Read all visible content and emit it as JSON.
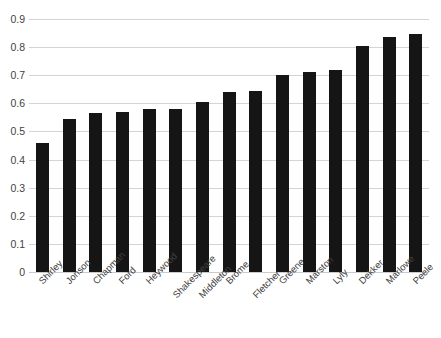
{
  "chart_data": {
    "type": "bar",
    "title": "",
    "subtitle": "",
    "xlabel": "",
    "ylabel": "",
    "ylim": [
      0,
      0.9
    ],
    "ytick_labels": [
      "0.9",
      "0.8",
      "0.7",
      "0.6",
      "0.5",
      "0.4",
      "0.3",
      "0.2",
      "0.1",
      "0"
    ],
    "ytick_values": [
      0.9,
      0.8,
      0.7,
      0.6,
      0.5,
      0.4,
      0.3,
      0.2,
      0.1,
      0
    ],
    "grid": "horizontal",
    "legend": "none",
    "bar_color": "#151515",
    "gridline_color": "#d2d4d8",
    "background": "#ffffff",
    "categories": [
      "Shirley",
      "Jonson",
      "Chapman",
      "Ford",
      "Heywood",
      "Shakespeare",
      "Middleton",
      "Brome",
      "Fletcher",
      "Greene",
      "Marston",
      "Lyly",
      "Dekker",
      "Marlowe",
      "Peele"
    ],
    "values": [
      0.46,
      0.545,
      0.565,
      0.57,
      0.58,
      0.58,
      0.605,
      0.64,
      0.645,
      0.7,
      0.71,
      0.72,
      0.805,
      0.835,
      0.845
    ],
    "label_rotation": -45
  }
}
